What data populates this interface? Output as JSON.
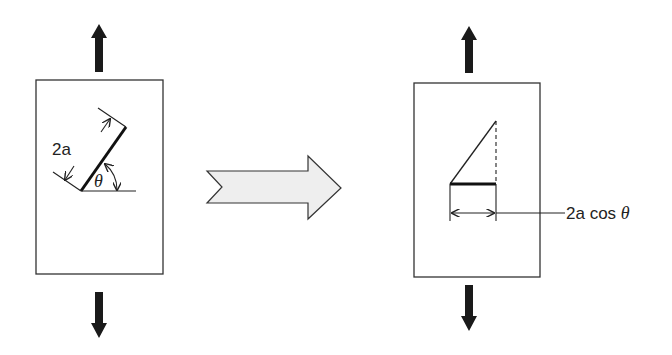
{
  "diagram": {
    "title": "",
    "left_panel": {
      "description": "Plate under uniaxial tension with inclined crack of length 2a at angle theta",
      "crack_length_label": "2a",
      "angle_label": "θ",
      "load_top": "tension-up-arrow",
      "load_bottom": "tension-down-arrow"
    },
    "transition_arrow": {
      "icon": "right-block-arrow",
      "fill": "#eeeeee"
    },
    "right_panel": {
      "description": "Equivalent projected crack perpendicular to load",
      "projected_length_label": "2a cos θ",
      "projected_length_prefix": "2a",
      "projected_length_func": " cos ",
      "projected_length_angle": "θ",
      "load_top": "tension-up-arrow",
      "load_bottom": "tension-down-arrow"
    },
    "colors": {
      "line": "#222222",
      "arrow_fill": "#1a1a1a",
      "block_arrow_fill": "#eeeeee",
      "background": "#ffffff"
    }
  }
}
